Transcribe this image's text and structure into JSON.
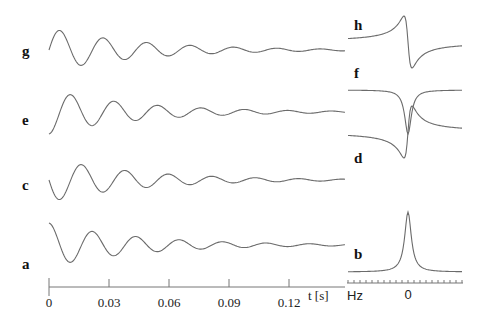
{
  "chart_data": [
    {
      "type": "line",
      "title": "",
      "xlabel": "t [s]",
      "ylabel": "",
      "xlim": [
        0,
        0.148
      ],
      "x_ticks": [
        "0",
        "0.03",
        "0.06",
        "0.09",
        "0.12"
      ],
      "x_tick_values": [
        0,
        0.03,
        0.06,
        0.09,
        0.12
      ],
      "grid": false,
      "legend": "none (traces labelled a, c, e, g on left)",
      "description": "Damped oscillating time-domain signals (FIDs), ~46 Hz, decaying amplitude",
      "series": [
        {
          "name": "g",
          "label": "g",
          "phase_deg": 270,
          "amplitude": 22,
          "decay_per_s": 22
        },
        {
          "name": "e",
          "label": "e",
          "phase_deg": 180,
          "amplitude": 22,
          "decay_per_s": 22
        },
        {
          "name": "c",
          "label": "c",
          "phase_deg": 90,
          "amplitude": 22,
          "decay_per_s": 22
        },
        {
          "name": "a",
          "label": "a",
          "phase_deg": 0,
          "amplitude": 22,
          "decay_per_s": 22
        }
      ]
    },
    {
      "type": "line",
      "title": "",
      "xlabel": "Hz",
      "ylabel": "",
      "x_ticks": [
        "0"
      ],
      "grid": false,
      "legend": "none (traces labelled b, d, f, h on left)",
      "description": "Frequency-domain Lorentzian line shapes centred at 0 Hz",
      "series": [
        {
          "name": "h",
          "label": "h",
          "shape": "dispersion, inverted (positive left, negative right)"
        },
        {
          "name": "f",
          "label": "f",
          "shape": "absorption, inverted (negative peak)"
        },
        {
          "name": "d",
          "label": "d",
          "shape": "dispersion (negative left, positive right)"
        },
        {
          "name": "b",
          "label": "b",
          "shape": "absorption (positive peak)"
        }
      ]
    }
  ],
  "labels": {
    "time_panel": [
      "g",
      "e",
      "c",
      "a"
    ],
    "freq_panel": [
      "h",
      "f",
      "d",
      "b"
    ],
    "time_axis_title": "t [s]",
    "time_ticks": [
      "0",
      "0.03",
      "0.06",
      "0.09",
      "0.12"
    ],
    "freq_axis_title": "Hz",
    "freq_tick": "0"
  }
}
